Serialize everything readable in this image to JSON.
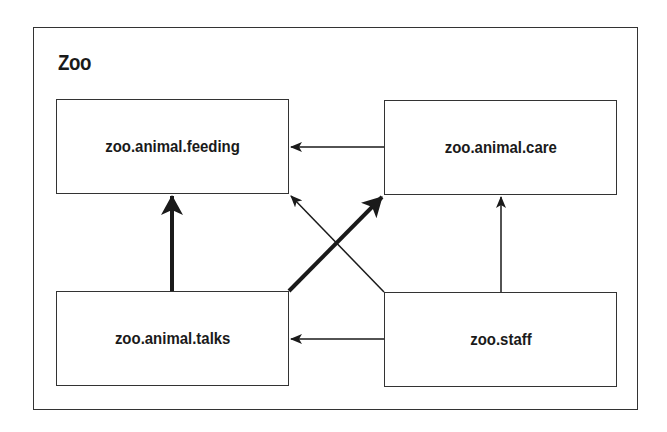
{
  "diagram": {
    "title": "Zoo",
    "nodes": [
      {
        "id": "feeding",
        "label": "zoo.animal.feeding"
      },
      {
        "id": "care",
        "label": "zoo.animal.care"
      },
      {
        "id": "talks",
        "label": "zoo.animal.talks"
      },
      {
        "id": "staff",
        "label": "zoo.staff"
      }
    ],
    "edges": [
      {
        "from": "zoo.animal.care",
        "to": "zoo.animal.feeding",
        "weight": "thin"
      },
      {
        "from": "zoo.animal.talks",
        "to": "zoo.animal.feeding",
        "weight": "thick"
      },
      {
        "from": "zoo.animal.talks",
        "to": "zoo.animal.care",
        "weight": "thick"
      },
      {
        "from": "zoo.staff",
        "to": "zoo.animal.feeding",
        "weight": "thin"
      },
      {
        "from": "zoo.staff",
        "to": "zoo.animal.care",
        "weight": "thin"
      },
      {
        "from": "zoo.staff",
        "to": "zoo.animal.talks",
        "weight": "thin"
      }
    ],
    "colors": {
      "line": "#1a1a1a",
      "background": "#ffffff"
    }
  }
}
